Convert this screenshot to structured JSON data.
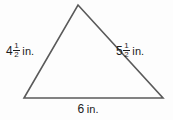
{
  "figure": {
    "shape_name": "triangle",
    "stroke_color": "#5a5a5a",
    "text_color": "#1c1c1c",
    "background_color": "#fdfdfd",
    "vertices": {
      "apex": {
        "x": 78,
        "y": 5
      },
      "bottom_left": {
        "x": 24,
        "y": 98
      },
      "bottom_right": {
        "x": 163,
        "y": 98
      }
    }
  },
  "labels": {
    "left_side": {
      "whole": "4",
      "numerator": "1",
      "denominator": "2",
      "unit": "in.",
      "full_text": "4 1/2 in."
    },
    "right_side": {
      "whole": "5",
      "numerator": "1",
      "denominator": "2",
      "unit": "in.",
      "full_text": "5 1/2 in."
    },
    "base": {
      "whole": "6",
      "unit": "in.",
      "full_text": "6 in."
    }
  }
}
